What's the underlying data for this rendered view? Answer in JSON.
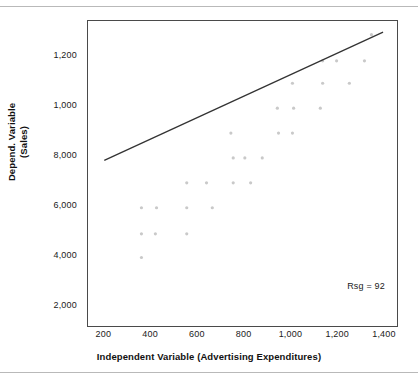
{
  "figure": {
    "annotation": "Rsg = 92",
    "y_axis_title_line1": "Depend. Variable",
    "y_axis_title_line2": "(Sales)",
    "x_axis_title": "Independent Variable (Advertising Expenditures)"
  },
  "chart_data": {
    "type": "scatter",
    "title": "",
    "xlabel": "Independent Variable (Advertising Expenditures)",
    "ylabel": "Depend. Variable (Sales)",
    "annotations": [
      {
        "text": "Rsg = 92",
        "x": 1180,
        "y": 3100
      }
    ],
    "grid": false,
    "legend": "none",
    "xlim": [
      130,
      1460
    ],
    "ylim": [
      1150,
      13400
    ],
    "xticks": [
      200,
      400,
      600,
      800,
      1000,
      1200,
      1400
    ],
    "xtick_labels": [
      "200",
      "400",
      "600",
      "800",
      "1,000",
      "1,200",
      "1,400"
    ],
    "yticks": [
      2000,
      4000,
      6000,
      8000,
      10000,
      12000
    ],
    "ytick_labels": [
      "2,000",
      "4,000",
      "6,000",
      "8,000",
      "1,000",
      "1,200"
    ],
    "points": [
      {
        "x": 360,
        "y": 3900
      },
      {
        "x": 360,
        "y": 4850
      },
      {
        "x": 420,
        "y": 4850
      },
      {
        "x": 555,
        "y": 4850
      },
      {
        "x": 360,
        "y": 5900
      },
      {
        "x": 425,
        "y": 5900
      },
      {
        "x": 555,
        "y": 5900
      },
      {
        "x": 665,
        "y": 5900
      },
      {
        "x": 555,
        "y": 6900
      },
      {
        "x": 640,
        "y": 6900
      },
      {
        "x": 755,
        "y": 6900
      },
      {
        "x": 830,
        "y": 6900
      },
      {
        "x": 755,
        "y": 7900
      },
      {
        "x": 805,
        "y": 7900
      },
      {
        "x": 880,
        "y": 7900
      },
      {
        "x": 745,
        "y": 8900
      },
      {
        "x": 950,
        "y": 8900
      },
      {
        "x": 1010,
        "y": 8900
      },
      {
        "x": 945,
        "y": 9900
      },
      {
        "x": 1015,
        "y": 9900
      },
      {
        "x": 1130,
        "y": 9900
      },
      {
        "x": 1010,
        "y": 10900
      },
      {
        "x": 1140,
        "y": 10900
      },
      {
        "x": 1255,
        "y": 10900
      },
      {
        "x": 1140,
        "y": 11800
      },
      {
        "x": 1200,
        "y": 11800
      },
      {
        "x": 1320,
        "y": 11800
      },
      {
        "x": 1350,
        "y": 12850
      }
    ],
    "trendline": {
      "type": "linear",
      "x_start": 200,
      "y_start": 7800,
      "x_end": 1400,
      "y_end": 12950,
      "color": "#333333"
    },
    "point_color": "#c9c9c9",
    "point_size": 1.6
  }
}
